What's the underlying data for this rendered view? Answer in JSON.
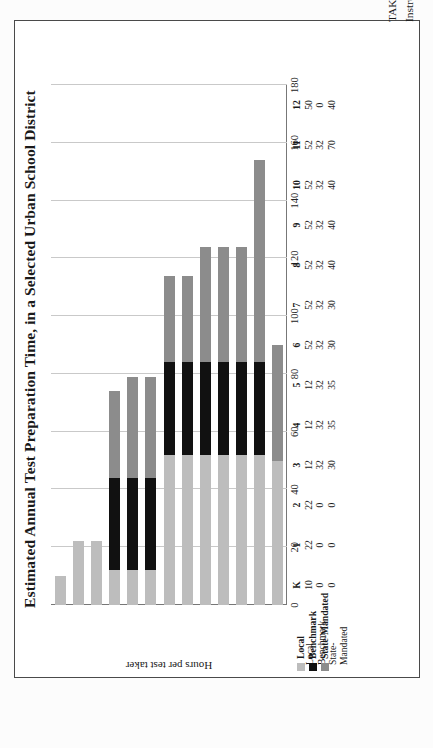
{
  "figure": {
    "title": "Estimated Annual Test Preparation Time, in a Selected Urban School District",
    "source_note": "TAKEN FROM: Howard Nelson, “Testing More, Teaching Less: What America’s Obsession with Student Testing Costs in Money and Lost Instructional Time,” American Federation of Teachers, July 2013."
  },
  "legend": {
    "items": [
      {
        "label": "Local",
        "color": "#bdbdbd",
        "swatch": "local-swatch"
      },
      {
        "label": "Benchmark",
        "color": "#111111",
        "swatch": "benchmark-swatch"
      },
      {
        "label": "State-Mandated",
        "color": "#8c8c8c",
        "swatch": "state-mandated-swatch"
      }
    ]
  },
  "axis": {
    "value_label": "Hours per test taker",
    "ticks": [
      "0",
      "20",
      "40",
      "60",
      "80",
      "100",
      "120",
      "140",
      "160",
      "180"
    ]
  },
  "chart_data": {
    "type": "bar",
    "title": "Estimated Annual Test Preparation Time, in a Selected Urban School District",
    "subtype": "stacked-horizontal",
    "xlabel": "",
    "ylabel": "Hours per test taker",
    "ylim": [
      0,
      180
    ],
    "ytick_step": 20,
    "grid": true,
    "legend_position": "bottom-left",
    "categories": [
      "K",
      "1",
      "2",
      "3",
      "4",
      "5",
      "6",
      "7",
      "8",
      "9",
      "10",
      "11",
      "12"
    ],
    "series": [
      {
        "name": "Local",
        "color": "#bdbdbd",
        "values": [
          10,
          22,
          22,
          12,
          12,
          12,
          52,
          52,
          52,
          52,
          52,
          52,
          50
        ]
      },
      {
        "name": "Benchmark",
        "color": "#111111",
        "values": [
          0,
          0,
          0,
          32,
          32,
          32,
          32,
          32,
          32,
          32,
          32,
          32,
          0
        ]
      },
      {
        "name": "State-Mandated",
        "color": "#8c8c8c",
        "values": [
          0,
          0,
          0,
          30,
          35,
          35,
          30,
          30,
          40,
          40,
          40,
          70,
          40
        ]
      }
    ],
    "totals": [
      10,
      22,
      22,
      74,
      79,
      79,
      114,
      114,
      124,
      124,
      124,
      154,
      90
    ]
  },
  "data_table": {
    "row_labels": [
      "Local",
      "Benchmark",
      "State-Mandated"
    ],
    "columns": [
      {
        "grade": "K",
        "local": "10",
        "benchmark": "0",
        "state": "0"
      },
      {
        "grade": "1",
        "local": "22",
        "benchmark": "0",
        "state": "0"
      },
      {
        "grade": "2",
        "local": "22",
        "benchmark": "0",
        "state": "0"
      },
      {
        "grade": "3",
        "local": "12",
        "benchmark": "32",
        "state": "30"
      },
      {
        "grade": "4",
        "local": "12",
        "benchmark": "32",
        "state": "35"
      },
      {
        "grade": "5",
        "local": "12",
        "benchmark": "32",
        "state": "35"
      },
      {
        "grade": "6",
        "local": "52",
        "benchmark": "32",
        "state": "30"
      },
      {
        "grade": "7",
        "local": "52",
        "benchmark": "32",
        "state": "30"
      },
      {
        "grade": "8",
        "local": "52",
        "benchmark": "32",
        "state": "40"
      },
      {
        "grade": "9",
        "local": "52",
        "benchmark": "32",
        "state": "40"
      },
      {
        "grade": "10",
        "local": "52",
        "benchmark": "32",
        "state": "40"
      },
      {
        "grade": "11",
        "local": "52",
        "benchmark": "32",
        "state": "70"
      },
      {
        "grade": "12",
        "local": "50",
        "benchmark": "0",
        "state": "40"
      }
    ]
  }
}
